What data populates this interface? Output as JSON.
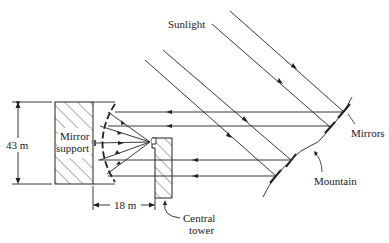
{
  "diagram": {
    "type": "solar-power-tower-schematic",
    "labels": {
      "sunlight": "Sunlight",
      "mirror_support_line1": "Mirror",
      "mirror_support_line2": "support",
      "height_dimension": "43 m",
      "distance_dimension": "18 m",
      "central_tower_line1": "Central",
      "central_tower_line2": "tower",
      "mirrors": "Mirrors",
      "mountain": "Mountain"
    },
    "colors": {
      "line": "#222222",
      "background": "#ffffff"
    }
  }
}
